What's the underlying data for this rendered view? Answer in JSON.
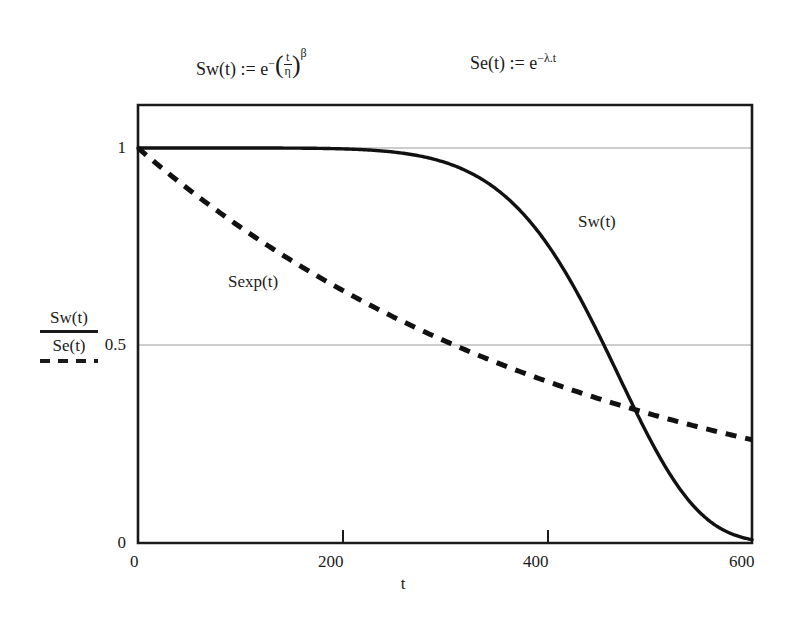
{
  "figure": {
    "formulas": {
      "weibull": {
        "lhs": "Sw(t) :=",
        "base": "e",
        "exp_minus": "−",
        "frac_num": "t",
        "frac_den": "η",
        "power": "β",
        "full_text": "Sw(t) := e^−(t/η)^β"
      },
      "exponential": {
        "lhs": "Se(t) :=",
        "base": "e",
        "exponent": "−λ.t",
        "full_text": "Se(t) := e^−λ.t"
      }
    },
    "legend": {
      "numerator_label": "Sw(t)",
      "denominator_label": "Se(t)",
      "numerator_style": "solid",
      "denominator_style": "dashed"
    },
    "annotations": [
      {
        "text": "Sw(t)",
        "series": "weibull"
      },
      {
        "text": "Sexp(t)",
        "series": "exponential"
      }
    ],
    "colors": {
      "curve": "#111111",
      "frame": "#1a1a1a",
      "gridline": "#b9b9b9",
      "background": "#ffffff"
    }
  },
  "chart_data": {
    "type": "line",
    "title": "",
    "subtitle": "",
    "xlabel": "t",
    "ylabel": "Sw(t) / Se(t)",
    "xlim": [
      0,
      600
    ],
    "ylim": [
      0,
      1.12
    ],
    "xticks": [
      0,
      200,
      400,
      600
    ],
    "xtick_labels": [
      "0",
      "200",
      "400",
      "600"
    ],
    "yticks": [
      0,
      0.5,
      1
    ],
    "ytick_labels": [
      "0",
      "0.5",
      "1"
    ],
    "grid": "horizontal-at-0.5-and-1",
    "legend_position": "y-axis-label",
    "series": [
      {
        "name": "Sw(t)",
        "style": "solid",
        "model": "weibull",
        "params": {
          "eta": 480,
          "beta": 7
        },
        "x": [
          0,
          50,
          100,
          150,
          200,
          250,
          280,
          300,
          320,
          340,
          360,
          380,
          400,
          420,
          440,
          460,
          480,
          500,
          520,
          540,
          560,
          580,
          600
        ],
        "values": [
          1.0,
          1.0,
          1.0,
          1.0,
          0.999,
          0.996,
          0.993,
          0.989,
          0.983,
          0.974,
          0.961,
          0.941,
          0.913,
          0.872,
          0.816,
          0.74,
          0.644,
          0.53,
          0.404,
          0.278,
          0.166,
          0.081,
          0.031
        ]
      },
      {
        "name": "Sexp(t)",
        "style": "dashed",
        "model": "exponential",
        "params": {
          "lambda": 0.002236
        },
        "x": [
          0,
          50,
          100,
          150,
          200,
          250,
          300,
          350,
          400,
          450,
          500,
          550,
          600
        ],
        "values": [
          1.0,
          0.894,
          0.8,
          0.715,
          0.639,
          0.572,
          0.511,
          0.457,
          0.409,
          0.366,
          0.327,
          0.292,
          0.262
        ]
      }
    ]
  }
}
